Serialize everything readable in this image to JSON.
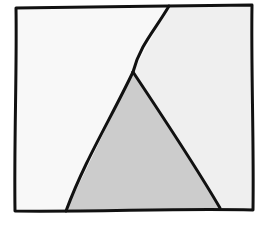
{
  "diagram": {
    "title": "",
    "stroke_color": "#111111",
    "regions": [
      {
        "id": "left-region",
        "fill": "#f8f8f8",
        "points": "16,8 169,6 133,72 66,211 15,211"
      },
      {
        "id": "right-region",
        "fill": "#efefef",
        "points": "169,6 252,5 253,210 220,208 133,72"
      },
      {
        "id": "triangle-region",
        "fill": "#cccccc",
        "points": "133,72 220,208 66,211"
      }
    ],
    "outline_path": "M16,8 C80,7 180,6 252,5 C251,70 254,140 253,210 C180,208 100,212 15,211 C14,140 17,70 16,8 Z",
    "divider_path": "M169,6 C155,30 140,45 133,72",
    "triangle_left_edge": "M133,72 C110,120 85,160 66,211",
    "triangle_right_edge": "M133,72 C165,120 195,165 220,208"
  }
}
